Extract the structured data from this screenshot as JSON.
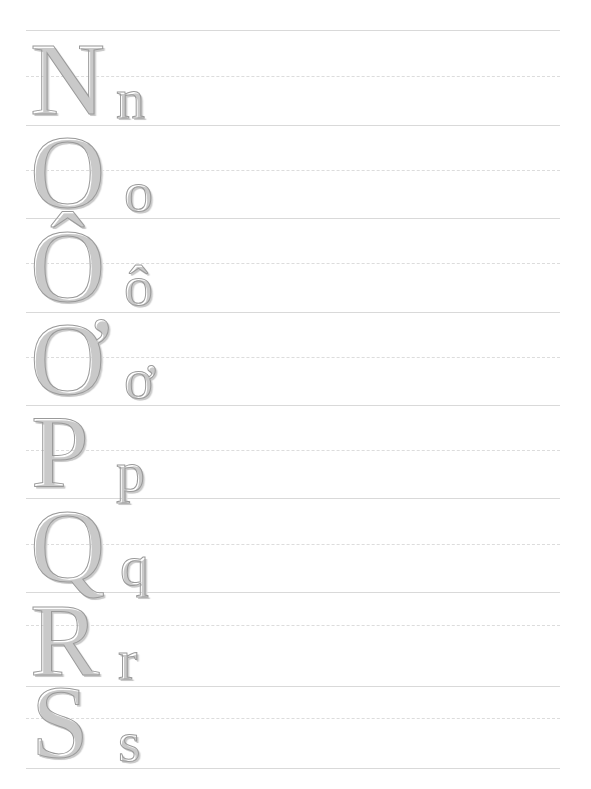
{
  "page": {
    "kind": "letter-tracing-worksheet",
    "alphabet": "Vietnamese",
    "width": 591,
    "height": 789,
    "background_color": "#ffffff"
  },
  "ruling": {
    "solid_line_color": "#d9d9d9",
    "dashed_line_color": "#dcdcdc",
    "line_left": 26,
    "line_right": 560,
    "line_width": 534,
    "row_height": 94,
    "style": "three-line: solid top, dashed middle, solid baseline"
  },
  "glyph_style": {
    "outline_color": "#9a9a9a",
    "shadow_color": "#c9c9c9",
    "fill": "hollow",
    "typeface_style": "serif-outline",
    "uppercase_size_px": 104,
    "lowercase_size_px": 58
  },
  "rows": [
    {
      "index": 1,
      "uppercase": "N",
      "lowercase": "n",
      "top_line_y": 30,
      "mid_line_y": 76,
      "base_line_y": 125,
      "upper_x": 30,
      "lower_x": 116
    },
    {
      "index": 2,
      "uppercase": "O",
      "lowercase": "o",
      "top_line_y": 125,
      "mid_line_y": 170,
      "base_line_y": 218,
      "upper_x": 30,
      "lower_x": 124
    },
    {
      "index": 3,
      "uppercase": "Ô",
      "lowercase": "ô",
      "top_line_y": 218,
      "mid_line_y": 263,
      "base_line_y": 312,
      "upper_x": 30,
      "lower_x": 124
    },
    {
      "index": 4,
      "uppercase": "Ơ",
      "lowercase": "ơ",
      "top_line_y": 312,
      "mid_line_y": 357,
      "base_line_y": 405,
      "upper_x": 30,
      "lower_x": 124
    },
    {
      "index": 5,
      "uppercase": "P",
      "lowercase": "p",
      "top_line_y": 405,
      "mid_line_y": 450,
      "base_line_y": 498,
      "upper_x": 31,
      "lower_x": 116
    },
    {
      "index": 6,
      "uppercase": "Q",
      "lowercase": "q",
      "top_line_y": 498,
      "mid_line_y": 544,
      "base_line_y": 592,
      "upper_x": 30,
      "lower_x": 120
    },
    {
      "index": 7,
      "uppercase": "R",
      "lowercase": "r",
      "top_line_y": 592,
      "mid_line_y": 625,
      "base_line_y": 686,
      "upper_x": 30,
      "lower_x": 118
    },
    {
      "index": 8,
      "uppercase": "S",
      "lowercase": "s",
      "top_line_y": 686,
      "mid_line_y": 718,
      "base_line_y": 768,
      "upper_x": 31,
      "lower_x": 118
    }
  ]
}
